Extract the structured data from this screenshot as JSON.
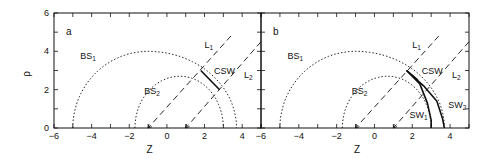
{
  "chart_data": [
    {
      "type": "line",
      "panel_label": "a",
      "xlabel": "Z",
      "ylabel": "ρ",
      "xlim": [
        -6,
        5
      ],
      "ylim": [
        0,
        6
      ],
      "xticks": [
        -6,
        -4,
        -2,
        0,
        2,
        4
      ],
      "yticks": [
        0,
        2,
        4,
        6
      ],
      "grid": false,
      "series": [
        {
          "name": "BS1",
          "style": "dotted",
          "shape": "arc",
          "z_start": -5.0,
          "z_end": 3.7,
          "peak_rho": 4.0,
          "peak_z": -1.0
        },
        {
          "name": "BS2",
          "style": "dotted",
          "shape": "arc",
          "z_start": -1.7,
          "z_end": 3.0,
          "peak_rho": 2.7,
          "peak_z": 0.7
        },
        {
          "name": "L1",
          "style": "dashed-arrow",
          "x": [
            3.4,
            -1.0
          ],
          "y": [
            4.8,
            0.0
          ]
        },
        {
          "name": "L2",
          "style": "dashed-arrow",
          "x": [
            5.0,
            1.0
          ],
          "y": [
            4.5,
            0.0
          ]
        },
        {
          "name": "CSW",
          "style": "solid",
          "x": [
            1.8,
            2.8
          ],
          "y": [
            3.0,
            2.0
          ]
        }
      ],
      "annotations": [
        "a",
        "BS1",
        "BS2",
        "L1",
        "L2",
        "CSW"
      ]
    },
    {
      "type": "line",
      "panel_label": "b",
      "xlabel": "Z",
      "ylabel": "",
      "xlim": [
        -6,
        5
      ],
      "ylim": [
        0,
        6
      ],
      "xticks": [
        -6,
        -4,
        -2,
        0,
        2,
        4
      ],
      "yticks": [
        0,
        2,
        4,
        6
      ],
      "grid": false,
      "series": [
        {
          "name": "BS1",
          "style": "dotted",
          "shape": "arc",
          "z_start": -5.0,
          "z_end": 3.7,
          "peak_rho": 4.0,
          "peak_z": -1.0
        },
        {
          "name": "BS2",
          "style": "dotted",
          "shape": "arc",
          "z_start": -1.7,
          "z_end": 3.0,
          "peak_rho": 2.7,
          "peak_z": 0.7
        },
        {
          "name": "L1",
          "style": "dashed-arrow",
          "x": [
            3.4,
            -1.0
          ],
          "y": [
            4.8,
            0.0
          ]
        },
        {
          "name": "L2",
          "style": "dashed-arrow",
          "x": [
            5.0,
            1.0
          ],
          "y": [
            4.5,
            0.0
          ]
        },
        {
          "name": "CSW",
          "style": "solid",
          "x": [
            1.7,
            2.3
          ],
          "y": [
            3.0,
            2.5
          ]
        },
        {
          "name": "SW1",
          "style": "solid",
          "x": [
            1.7,
            2.4,
            2.8,
            3.0,
            3.0
          ],
          "y": [
            3.0,
            2.3,
            1.3,
            0.4,
            0.0
          ]
        },
        {
          "name": "SW2",
          "style": "solid",
          "x": [
            1.7,
            2.6,
            3.3,
            3.6,
            3.7
          ],
          "y": [
            3.0,
            2.2,
            1.4,
            0.5,
            0.0
          ]
        }
      ],
      "annotations": [
        "b",
        "BS1",
        "BS2",
        "L1",
        "L2",
        "CSW",
        "SW1",
        "SW2"
      ]
    }
  ],
  "labels": {
    "xlabel": "Z",
    "ylabel": "ρ",
    "panel_a": "a",
    "panel_b": "b",
    "bs": "BS",
    "l": "L",
    "csw": "CSW",
    "sw": "SW",
    "sub1": "1",
    "sub2": "2",
    "xtick_labels": [
      "−6",
      "−4",
      "−2",
      "0",
      "2",
      "4"
    ],
    "ytick_labels": [
      "0",
      "2",
      "4",
      "6"
    ]
  }
}
